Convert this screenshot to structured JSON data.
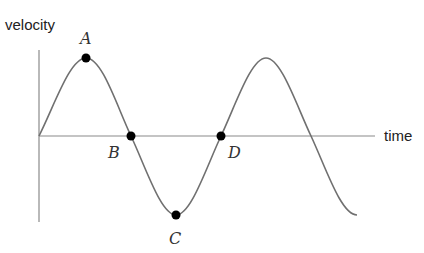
{
  "diagram": {
    "y_axis_label": "velocity",
    "x_axis_label": "time",
    "curve": "sine wave of velocity vs time, starting at origin",
    "points": [
      {
        "label": "A",
        "description": "maximum (crest)"
      },
      {
        "label": "B",
        "description": "zero crossing, going down"
      },
      {
        "label": "C",
        "description": "minimum (trough)"
      },
      {
        "label": "D",
        "description": "zero crossing, going up"
      }
    ],
    "colors": {
      "curve": "#777777",
      "axis": "#888888",
      "point": "#000000"
    }
  }
}
